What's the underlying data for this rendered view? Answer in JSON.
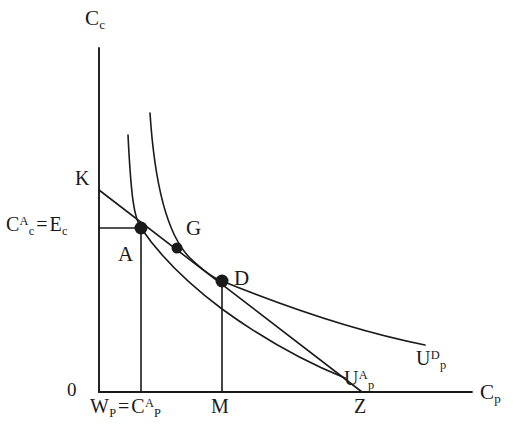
{
  "figure": {
    "type": "indifference-curve-diagram",
    "background": "#ffffff",
    "ink": "#1a1a1a",
    "width": 524,
    "height": 435
  },
  "axes": {
    "y_axis": {
      "label_main": "C",
      "label_sub": "c",
      "x": 99,
      "top": 48,
      "bottom": 392
    },
    "x_axis": {
      "label_main": "C",
      "label_sub": "p",
      "y": 392,
      "left": 99,
      "right": 472
    },
    "origin": {
      "label": "0",
      "x": 75,
      "y": 390
    }
  },
  "y_ticks": [
    {
      "name": "K",
      "label_main": "K",
      "y": 190,
      "value_text": "K"
    },
    {
      "name": "Cc_A_equals_Ec",
      "label_first_main": "C",
      "label_first_sub": "c",
      "label_first_sup": "A",
      "equals": "=",
      "label_second_main": "E",
      "label_second_sub": "c",
      "y": 228
    }
  ],
  "x_ticks": [
    {
      "name": "Wp_equals_Cp_A",
      "label_first_main": "W",
      "label_first_sub": "P",
      "equals": "=",
      "label_second_main": "C",
      "label_second_sub": "P",
      "label_second_sup": "A",
      "x": 141
    },
    {
      "name": "M",
      "label_main": "M",
      "x": 222
    },
    {
      "name": "Z",
      "label_main": "Z",
      "x": 362
    }
  ],
  "points": [
    {
      "name": "A",
      "label": "A",
      "x": 141,
      "y": 228,
      "label_x": 118,
      "label_y": 244,
      "radius": 6.5
    },
    {
      "name": "G",
      "label": "G",
      "x": 177,
      "y": 248,
      "label_x": 186,
      "label_y": 218,
      "radius": 5.5
    },
    {
      "name": "D",
      "label": "D",
      "x": 222,
      "y": 281,
      "label_x": 234,
      "label_y": 268,
      "radius": 6.5
    }
  ],
  "curves": [
    {
      "name": "indifference-curve-Up-A",
      "label_main": "U",
      "label_sub": "p",
      "label_sup": "A",
      "label_x": 344,
      "label_y": 368,
      "path": "M 128 135 C 131 196, 134 218, 141 228 C 160 256, 186 282, 222 309 C 262 338, 305 362, 345 378"
    },
    {
      "name": "indifference-curve-Up-D",
      "label_main": "U",
      "label_sub": "p",
      "label_sup": "D",
      "label_x": 416,
      "label_y": 348,
      "path": "M 150 113 C 155 190, 168 236, 190 258 C 208 275, 216 279, 222 281 C 276 303, 350 330, 425 345"
    }
  ],
  "lines": [
    {
      "name": "budget-line-K-Z",
      "from": {
        "x": 99,
        "y": 190
      },
      "to": {
        "x": 362,
        "y": 392
      },
      "description": "straight budget line from K through A, G and D to Z"
    },
    {
      "name": "horizontal-guide-to-A",
      "from": {
        "x": 99,
        "y": 228
      },
      "to": {
        "x": 141,
        "y": 228
      },
      "description": "horizontal dashed-style guide from Cc axis to point A"
    },
    {
      "name": "vertical-guide-A-to-Wp",
      "from": {
        "x": 141,
        "y": 228
      },
      "to": {
        "x": 141,
        "y": 392
      },
      "description": "vertical guide from A down to Wp = Cp^A"
    },
    {
      "name": "vertical-guide-D-to-M",
      "from": {
        "x": 222,
        "y": 281
      },
      "to": {
        "x": 222,
        "y": 392
      },
      "description": "vertical guide from D down to M"
    }
  ]
}
